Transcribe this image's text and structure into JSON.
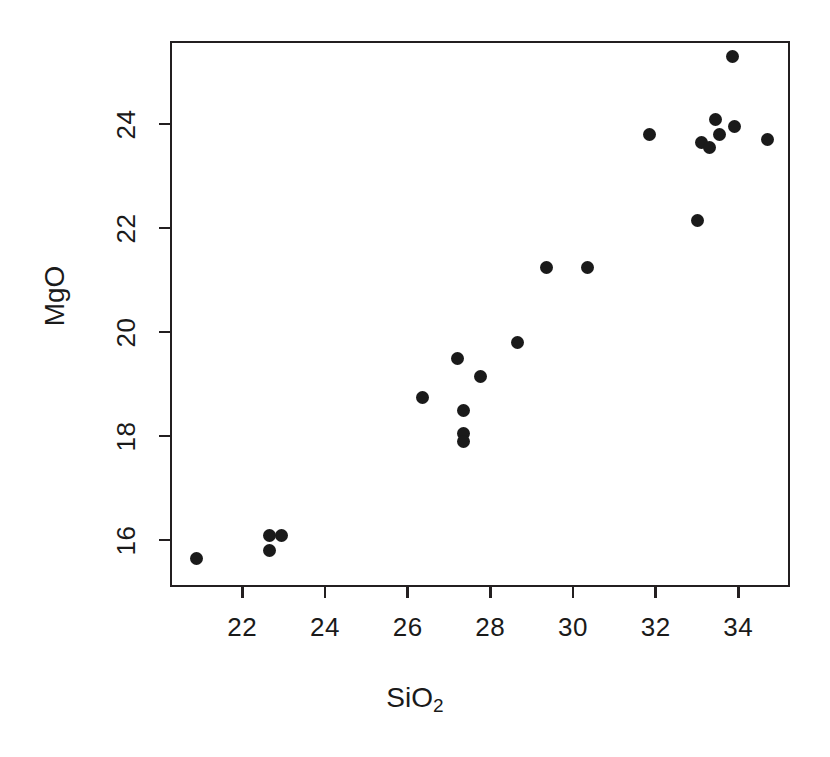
{
  "figure": {
    "background_color": "#ffffff",
    "foreground_color": "#1a1a1a",
    "frame_color": "#231f20"
  },
  "chart_data": {
    "type": "scatter",
    "title": "",
    "xlabel": "SiO2",
    "xlabel_base": "SiO",
    "xlabel_sub": "2",
    "ylabel": "MgO",
    "xlim": [
      20.25,
      35.25
    ],
    "ylim": [
      15.1,
      25.6
    ],
    "grid": false,
    "legend": null,
    "marker": "filled-circle",
    "marker_color": "#1a1a1a",
    "marker_size_px": 13,
    "xticks": [
      22,
      24,
      26,
      28,
      30,
      32,
      34
    ],
    "xtick_labels": [
      "22",
      "24",
      "26",
      "28",
      "30",
      "32",
      "34"
    ],
    "yticks": [
      16,
      18,
      20,
      22,
      24
    ],
    "ytick_labels": [
      "16",
      "18",
      "20",
      "22",
      "24"
    ],
    "points": [
      {
        "x": 20.9,
        "y": 15.65
      },
      {
        "x": 22.65,
        "y": 16.1
      },
      {
        "x": 22.65,
        "y": 15.8
      },
      {
        "x": 22.95,
        "y": 16.1
      },
      {
        "x": 26.35,
        "y": 18.75
      },
      {
        "x": 27.2,
        "y": 19.5
      },
      {
        "x": 27.35,
        "y": 18.5
      },
      {
        "x": 27.35,
        "y": 18.05
      },
      {
        "x": 27.35,
        "y": 17.9
      },
      {
        "x": 27.75,
        "y": 19.15
      },
      {
        "x": 28.65,
        "y": 19.8
      },
      {
        "x": 29.35,
        "y": 21.25
      },
      {
        "x": 30.35,
        "y": 21.25
      },
      {
        "x": 31.85,
        "y": 23.8
      },
      {
        "x": 33.0,
        "y": 22.15
      },
      {
        "x": 33.45,
        "y": 24.1
      },
      {
        "x": 33.1,
        "y": 23.65
      },
      {
        "x": 33.3,
        "y": 23.55
      },
      {
        "x": 33.55,
        "y": 23.8
      },
      {
        "x": 33.85,
        "y": 25.3
      },
      {
        "x": 33.9,
        "y": 23.95
      },
      {
        "x": 34.7,
        "y": 23.7
      }
    ]
  }
}
